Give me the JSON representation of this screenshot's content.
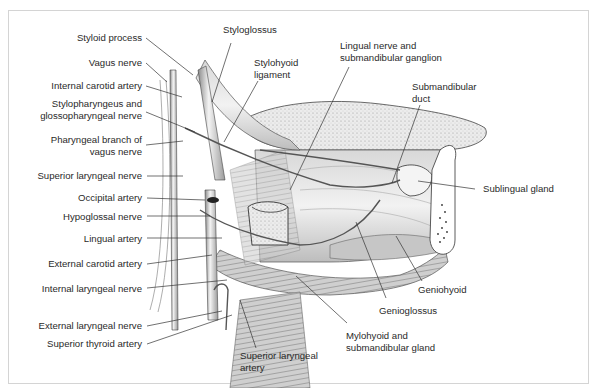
{
  "figure": {
    "type": "anatomical-illustration",
    "colors": {
      "line": "#2a2a2a",
      "shade": "#9a9a9a",
      "frame": "#d4d4d4",
      "background": "#ffffff"
    }
  },
  "labels": {
    "left": [
      {
        "id": "styloid-process",
        "text": "Styloid process"
      },
      {
        "id": "vagus-nerve",
        "text": "Vagus nerve"
      },
      {
        "id": "internal-carotid-artery",
        "text": "Internal carotid artery"
      },
      {
        "id": "stylopharyngeus",
        "line1": "Stylopharyngeus and",
        "line2": "glossopharyngeal nerve"
      },
      {
        "id": "pharyngeal-branch",
        "line1": "Pharyngeal branch of",
        "line2": "vagus nerve"
      },
      {
        "id": "superior-laryngeal-nerve",
        "text": "Superior laryngeal nerve"
      },
      {
        "id": "occipital-artery",
        "text": "Occipital artery"
      },
      {
        "id": "hypoglossal-nerve",
        "text": "Hypoglossal nerve"
      },
      {
        "id": "lingual-artery",
        "text": "Lingual artery"
      },
      {
        "id": "external-carotid-artery",
        "text": "External carotid artery"
      },
      {
        "id": "internal-laryngeal-nerve",
        "text": "Internal laryngeal nerve"
      },
      {
        "id": "external-laryngeal-nerve",
        "text": "External laryngeal nerve"
      },
      {
        "id": "superior-thyroid-artery",
        "text": "Superior thyroid artery"
      }
    ],
    "top": [
      {
        "id": "styloglossus",
        "text": "Styloglossus"
      },
      {
        "id": "stylohyoid-ligament",
        "line1": "Stylohyoid",
        "line2": "ligament"
      },
      {
        "id": "lingual-nerve",
        "line1": "Lingual nerve and",
        "line2": "submandibular ganglion"
      },
      {
        "id": "submandibular-duct",
        "line1": "Submandibular",
        "line2": "duct"
      }
    ],
    "right": [
      {
        "id": "sublingual-gland",
        "text": "Sublingual gland"
      },
      {
        "id": "geniohyoid",
        "text": "Geniohyoid"
      },
      {
        "id": "genioglossus",
        "text": "Genioglossus"
      },
      {
        "id": "mylohyoid",
        "line1": "Mylohyoid and",
        "line2": "submandibular gland"
      }
    ],
    "bottom": [
      {
        "id": "superior-laryngeal-artery",
        "line1": "Superior laryngeal",
        "line2": "artery"
      }
    ]
  }
}
